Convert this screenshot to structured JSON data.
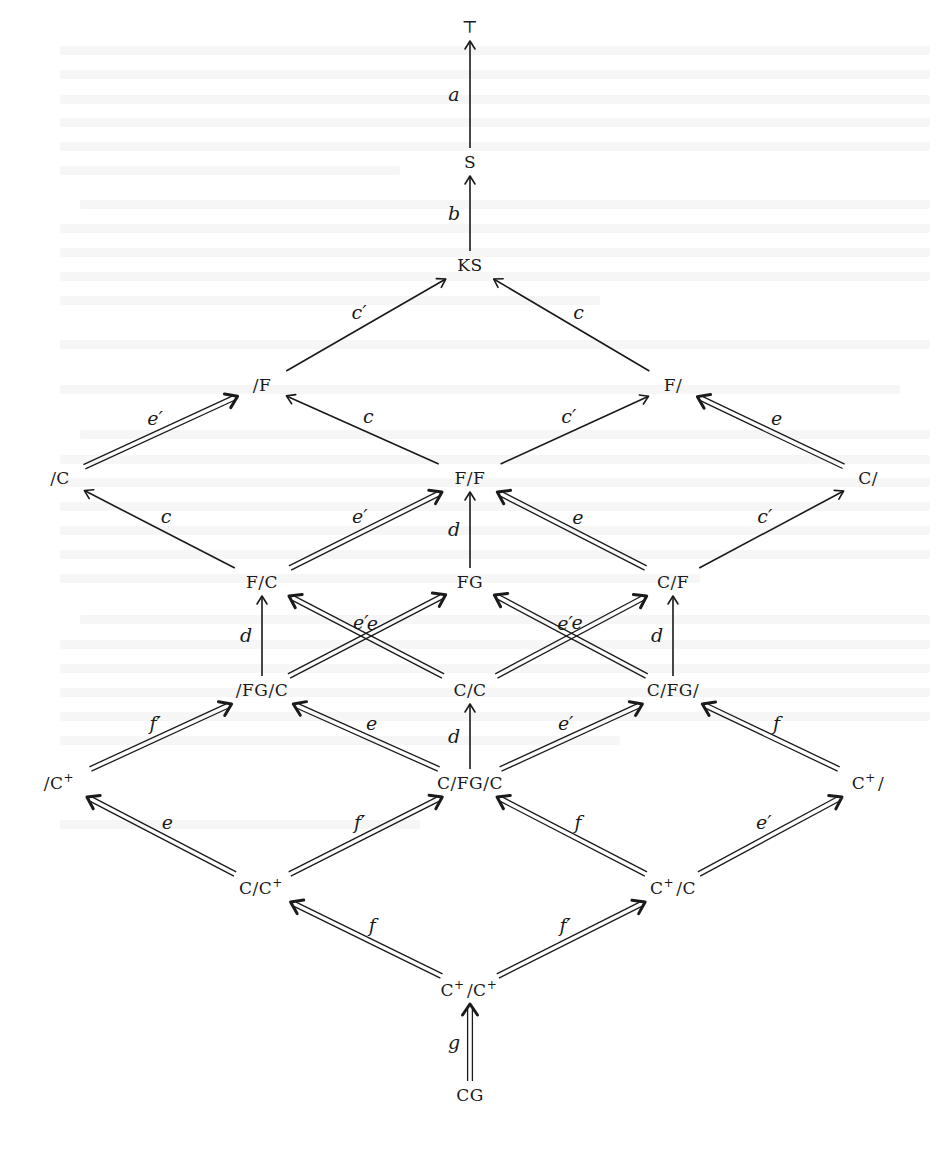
{
  "diagram": {
    "title": "",
    "colors": {
      "ink": "#1a1a1a",
      "paper": "#ffffff"
    },
    "nodes": [
      {
        "id": "top",
        "label": "⊤",
        "x": 470,
        "y": 27
      },
      {
        "id": "S",
        "label": "S",
        "x": 470,
        "y": 162
      },
      {
        "id": "KS",
        "label": "KS",
        "x": 470,
        "y": 265
      },
      {
        "id": "_F",
        "label": "/F",
        "x": 262,
        "y": 385
      },
      {
        "id": "F_",
        "label": "F/",
        "x": 673,
        "y": 385
      },
      {
        "id": "_C",
        "label": "/C",
        "x": 60,
        "y": 478
      },
      {
        "id": "F_F",
        "label": "F/F",
        "x": 470,
        "y": 478
      },
      {
        "id": "C_",
        "label": "C/",
        "x": 868,
        "y": 478
      },
      {
        "id": "F_C",
        "label": "F/C",
        "x": 262,
        "y": 582
      },
      {
        "id": "FG",
        "label": "FG",
        "x": 470,
        "y": 582
      },
      {
        "id": "C_F",
        "label": "C/F",
        "x": 673,
        "y": 582
      },
      {
        "id": "_FG_C",
        "label": "/FG/C",
        "x": 262,
        "y": 690
      },
      {
        "id": "C_C",
        "label": "C/C",
        "x": 470,
        "y": 690
      },
      {
        "id": "C_FG_",
        "label": "C/FG/",
        "x": 673,
        "y": 690
      },
      {
        "id": "_Cp",
        "label": "/C+",
        "x": 60,
        "y": 783
      },
      {
        "id": "C_FG_C",
        "label": "C/FG/C",
        "x": 470,
        "y": 783
      },
      {
        "id": "Cp_",
        "label": "C+/",
        "x": 868,
        "y": 783
      },
      {
        "id": "C_Cp",
        "label": "C/C+",
        "x": 262,
        "y": 888
      },
      {
        "id": "Cp_C",
        "label": "C+/C",
        "x": 673,
        "y": 888
      },
      {
        "id": "Cp_Cp",
        "label": "C+/C+",
        "x": 470,
        "y": 990
      },
      {
        "id": "CG",
        "label": "CG",
        "x": 470,
        "y": 1095
      }
    ],
    "edges": [
      {
        "from": "S",
        "to": "top",
        "label": "a",
        "style": "single"
      },
      {
        "from": "KS",
        "to": "S",
        "label": "b",
        "style": "single"
      },
      {
        "from": "_F",
        "to": "KS",
        "label": "c′",
        "style": "single"
      },
      {
        "from": "F_",
        "to": "KS",
        "label": "c",
        "style": "single"
      },
      {
        "from": "F_F",
        "to": "_F",
        "label": "c",
        "style": "single"
      },
      {
        "from": "F_F",
        "to": "F_",
        "label": "c′",
        "style": "single"
      },
      {
        "from": "_C",
        "to": "_F",
        "label": "e′",
        "style": "double"
      },
      {
        "from": "C_",
        "to": "F_",
        "label": "e",
        "style": "double"
      },
      {
        "from": "F_C",
        "to": "_C",
        "label": "c",
        "style": "single"
      },
      {
        "from": "F_C",
        "to": "F_F",
        "label": "e′",
        "style": "double"
      },
      {
        "from": "FG",
        "to": "F_F",
        "label": "d",
        "style": "single"
      },
      {
        "from": "C_F",
        "to": "F_F",
        "label": "e",
        "style": "double"
      },
      {
        "from": "C_F",
        "to": "C_",
        "label": "c′",
        "style": "single"
      },
      {
        "from": "_FG_C",
        "to": "F_C",
        "label": "d",
        "style": "single"
      },
      {
        "from": "C_C",
        "to": "F_C",
        "label": "e",
        "style": "double"
      },
      {
        "from": "_FG_C",
        "to": "FG",
        "label": "e′",
        "style": "double"
      },
      {
        "from": "C_FG_",
        "to": "FG",
        "label": "e",
        "style": "double"
      },
      {
        "from": "C_C",
        "to": "C_F",
        "label": "e′",
        "style": "double"
      },
      {
        "from": "C_FG_",
        "to": "C_F",
        "label": "d",
        "style": "single"
      },
      {
        "from": "C_FG_C",
        "to": "C_C",
        "label": "d",
        "style": "single"
      },
      {
        "from": "_Cp",
        "to": "_FG_C",
        "label": "f′",
        "style": "double"
      },
      {
        "from": "C_FG_C",
        "to": "_FG_C",
        "label": "e",
        "style": "double"
      },
      {
        "from": "C_FG_C",
        "to": "C_FG_",
        "label": "e′",
        "style": "double"
      },
      {
        "from": "Cp_",
        "to": "C_FG_",
        "label": "f",
        "style": "double"
      },
      {
        "from": "C_Cp",
        "to": "_Cp",
        "label": "e",
        "style": "double"
      },
      {
        "from": "C_Cp",
        "to": "C_FG_C",
        "label": "f′",
        "style": "double"
      },
      {
        "from": "Cp_C",
        "to": "C_FG_C",
        "label": "f",
        "style": "double"
      },
      {
        "from": "Cp_C",
        "to": "Cp_",
        "label": "e′",
        "style": "double"
      },
      {
        "from": "Cp_Cp",
        "to": "C_Cp",
        "label": "f",
        "style": "double"
      },
      {
        "from": "Cp_Cp",
        "to": "Cp_C",
        "label": "f′",
        "style": "double"
      },
      {
        "from": "CG",
        "to": "Cp_Cp",
        "label": "g",
        "style": "double"
      }
    ]
  }
}
